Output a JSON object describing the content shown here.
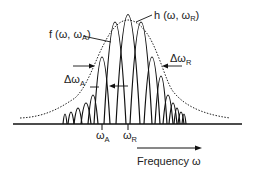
{
  "diagram": {
    "labels": {
      "f_func": "f (ω, ω",
      "f_sub": "A",
      "f_close": ")",
      "h_func": "h (ω, ω",
      "h_sub": "R",
      "h_close": ")",
      "delta_a": "Δω",
      "delta_a_sub": "A",
      "delta_r": "Δω",
      "delta_r_sub": "R",
      "omega_a": "ω",
      "omega_a_sub": "A",
      "omega_r": "ω",
      "omega_r_sub": "R",
      "axis": "Frequency ω"
    },
    "colors": {
      "line": "#111111",
      "text": "#222222",
      "background": "#ffffff"
    }
  }
}
